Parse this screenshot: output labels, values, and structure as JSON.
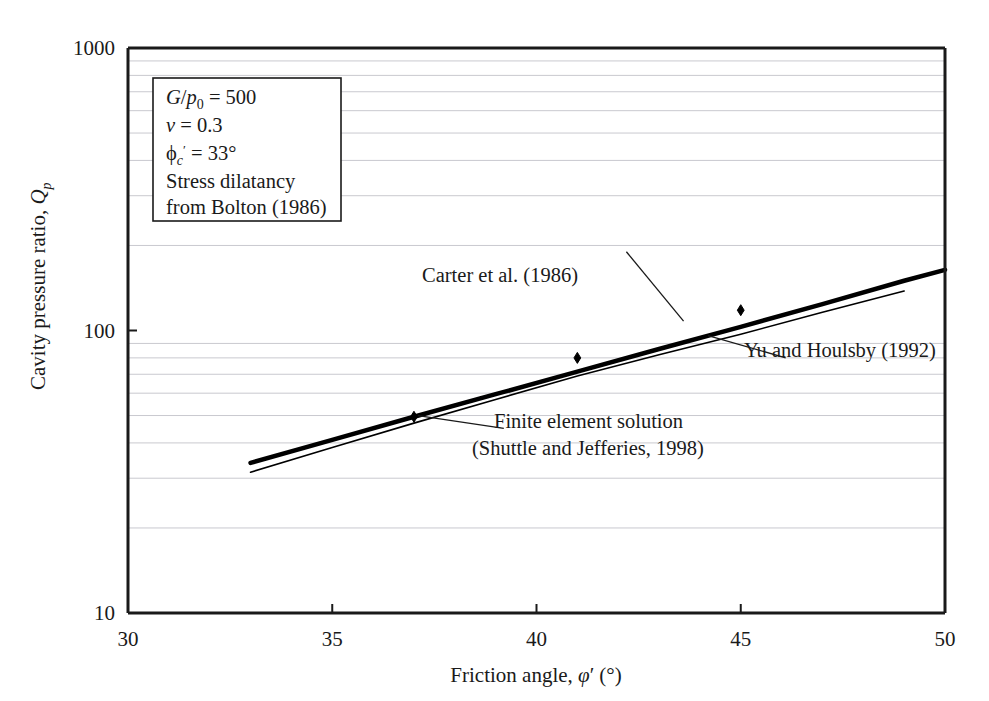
{
  "chart_data": {
    "type": "line",
    "title": "",
    "xlabel": "Friction angle, φ′ (°)",
    "ylabel": "Cavity pressure ratio, Q_p",
    "xlabel_parts": {
      "prefix": "Friction angle, ",
      "symbol": "φ",
      "prime": "′",
      "units": "(°)"
    },
    "ylabel_parts": {
      "prefix": "Cavity pressure ratio, ",
      "symbol": "Q",
      "subscript": "p"
    },
    "xlim": [
      30,
      50
    ],
    "ylim": [
      10,
      1000
    ],
    "yscale": "log",
    "xscale": "linear",
    "xticks": [
      30,
      35,
      40,
      45,
      50
    ],
    "xticklabels": [
      "30",
      "35",
      "40",
      "45",
      "50"
    ],
    "yticks": [
      10,
      100,
      1000
    ],
    "yticklabels": [
      "10",
      "100",
      "1000"
    ],
    "grid": "horizontal-minor-log",
    "legend": "none",
    "series": [
      {
        "name": "Carter et al. (1986)",
        "style": "thick-solid",
        "color": "#000000",
        "linewidth": 4.5,
        "x": [
          33,
          35,
          37,
          39,
          41,
          43,
          45,
          47,
          49,
          50
        ],
        "y": [
          34.0,
          41.0,
          49.5,
          59.5,
          71.5,
          86.0,
          103.0,
          124.0,
          150.0,
          164.0
        ]
      },
      {
        "name": "Yu and Houlsby (1992)",
        "style": "thin-solid",
        "color": "#000000",
        "linewidth": 1.6,
        "x": [
          33,
          35,
          37,
          39,
          41,
          43,
          45,
          47,
          49
        ],
        "y": [
          31.5,
          38.5,
          47.0,
          57.0,
          69.0,
          82.0,
          97.0,
          116.0,
          138.0
        ]
      },
      {
        "name": "Finite element solution (Shuttle and Jefferies, 1998)",
        "style": "markers",
        "marker": "diamond",
        "color": "#000000",
        "x": [
          37,
          41,
          45
        ],
        "y": [
          49.5,
          80.0,
          118.0
        ]
      }
    ],
    "annotations": [
      {
        "id": "carter",
        "text": "Carter et al. (1986)",
        "text_x": 42.2,
        "text_y": 205,
        "leader_from": [
          42.2,
          190
        ],
        "leader_to": [
          43.6,
          108
        ]
      },
      {
        "id": "yu-houlsby",
        "text": "Yu and Houlsby (1992)",
        "text_x": 46.2,
        "text_y": 77,
        "leader_from": [
          46.1,
          80
        ],
        "leader_to": [
          44.2,
          96
        ]
      },
      {
        "id": "fe-solution",
        "line1": "Finite element solution",
        "line2": "(Shuttle and Jefferies, 1998)",
        "text_x": 39.3,
        "text_y": 43,
        "leader_from": [
          39.2,
          45
        ],
        "leader_to": [
          37.1,
          50
        ]
      }
    ],
    "textbox": {
      "lines": [
        {
          "parts": [
            {
              "t": "G",
              "style": "italic"
            },
            {
              "t": "/",
              "style": "normal"
            },
            {
              "t": "p",
              "style": "italic"
            },
            {
              "t": "0",
              "style": "sub"
            },
            {
              "t": " = 500",
              "style": "normal"
            }
          ],
          "plain": "G/p0 = 500"
        },
        {
          "parts": [
            {
              "t": "ν",
              "style": "italic"
            },
            {
              "t": " = 0.3",
              "style": "normal"
            }
          ],
          "plain": "ν = 0.3"
        },
        {
          "parts": [
            {
              "t": "ϕ",
              "style": "normal"
            },
            {
              "t": "c",
              "style": "sub-italic"
            },
            {
              "t": "′",
              "style": "sup"
            },
            {
              "t": " = 33°",
              "style": "normal"
            }
          ],
          "plain": "ϕc′ = 33°"
        },
        {
          "parts": [
            {
              "t": "Stress dilatancy",
              "style": "normal"
            }
          ],
          "plain": "Stress dilatancy"
        },
        {
          "parts": [
            {
              "t": "from Bolton (1986)",
              "style": "normal"
            }
          ],
          "plain": "from Bolton (1986)"
        }
      ]
    }
  },
  "colors": {
    "axis": "#1a1a1a",
    "gridline": "#c9c9cf",
    "curve": "#000000",
    "background": "#ffffff"
  }
}
